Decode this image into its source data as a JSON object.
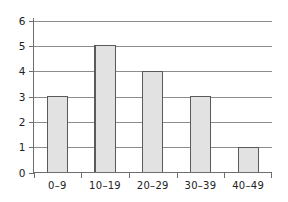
{
  "chart_data": {
    "type": "bar",
    "title": "",
    "subtitle": "",
    "xlabel": "",
    "ylabel": "",
    "categories": [
      "0–9",
      "10–19",
      "20–29",
      "30–39",
      "40–49"
    ],
    "values": [
      3,
      5,
      4,
      3,
      1
    ],
    "series": [
      {
        "name": "Frequency",
        "values": [
          3,
          5,
          4,
          3,
          1
        ]
      }
    ],
    "ylim": [
      0,
      6
    ],
    "y_ticks": [
      0,
      1,
      2,
      3,
      4,
      5,
      6
    ],
    "y_tick_labels": [
      "0",
      "1",
      "2",
      "3",
      "4",
      "5",
      "6"
    ],
    "x_tick_labels": [
      "0–9",
      "10–19",
      "20–29",
      "30–39",
      "40–49"
    ],
    "grid": true,
    "grid_axis": "y",
    "legend": false,
    "legend_position": "none",
    "annotations": [],
    "colors": {
      "bar_fill": "#e2e2e2",
      "bar_stroke": "#5a5a5a",
      "grid": "#8c8c8c",
      "axis": "#6e6e6e",
      "text": "#222222",
      "background": "#ffffff"
    }
  }
}
